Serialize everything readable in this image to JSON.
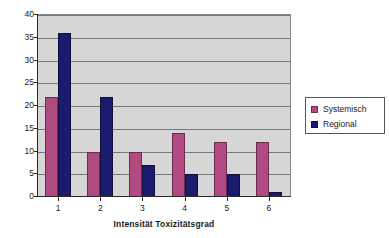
{
  "chart_data": {
    "type": "bar",
    "title": "",
    "subtitle": "",
    "xlabel": "Intensität Toxizitätsgrad",
    "ylabel": "Anzahl d. Patienten",
    "categories": [
      "1",
      "2",
      "3",
      "4",
      "5",
      "6"
    ],
    "series": [
      {
        "name": "Systemisch",
        "color": "#b04a80",
        "values": [
          22,
          10,
          10,
          14,
          12,
          12
        ]
      },
      {
        "name": "Regional",
        "color": "#1b1b6e",
        "values": [
          36,
          22,
          7,
          5,
          5,
          1
        ]
      }
    ],
    "ylim": [
      0,
      40
    ],
    "ytick_step": 5,
    "yticks": [
      "0",
      "5",
      "10",
      "15",
      "20",
      "25",
      "30",
      "35",
      "40"
    ],
    "grid": true,
    "grid_axis": "y",
    "legend_position": "right",
    "plot_background": "#d6d6d6",
    "gridline_color": "#777777",
    "axis_color": "#2a2a2a"
  },
  "legend": {
    "entries": [
      {
        "label": "Systemisch"
      },
      {
        "label": "Regional"
      }
    ]
  }
}
